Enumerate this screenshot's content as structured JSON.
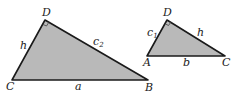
{
  "colors": {
    "fill": "#b9b9b9",
    "stroke": "#1a1a1a",
    "background": "#ffffff"
  },
  "triangles": [
    {
      "name": "large-triangle",
      "vertices": {
        "D": [
          45,
          20
        ],
        "C": [
          12,
          80
        ],
        "B": [
          148,
          80
        ]
      },
      "right_angle_at": "D",
      "labels": {
        "D": "D",
        "C": "C",
        "B": "B",
        "side_CD": "h",
        "side_DB": "c",
        "side_DB_sub": "2",
        "side_CB": "a"
      }
    },
    {
      "name": "small-triangle",
      "vertices": {
        "D": [
          167,
          20
        ],
        "A": [
          147,
          56
        ],
        "C": [
          225,
          56
        ]
      },
      "right_angle_at": "D",
      "labels": {
        "D": "D",
        "A": "A",
        "C": "C",
        "side_AD": "c",
        "side_AD_sub": "1",
        "side_DC": "h",
        "side_AC": "b"
      }
    }
  ]
}
